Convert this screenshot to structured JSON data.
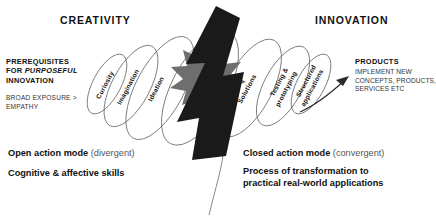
{
  "headings": {
    "left": "CREATIVITY",
    "right": "INNOVATION"
  },
  "left_block": {
    "title_line1": "PREREQUISITES",
    "title_line2_pre": "FOR ",
    "title_line2_em": "PURPOSEFUL",
    "title_line3": "INNOVATION",
    "sub": "BROAD EXPOSURE > EMPATHY"
  },
  "right_block": {
    "title": "PRODUCTS",
    "sub": "IMPLEMENT NEW CONCEPTS, PRODUCTS, SERVICES ETC"
  },
  "stages": [
    {
      "label": "Curiosity",
      "side": "creativity"
    },
    {
      "label": "Imagination",
      "side": "creativity"
    },
    {
      "label": "Ideation",
      "side": "creativity"
    },
    {
      "label": "Solutions",
      "side": "innovation"
    },
    {
      "label": "Testing &",
      "label2": "prototyping",
      "side": "innovation"
    },
    {
      "label": "Structured",
      "label2": "applications",
      "side": "innovation"
    }
  ],
  "bottom": {
    "left_bold": "Open action mode",
    "left_light": " (divergent)",
    "left_line2": "Cognitive & affective skills",
    "right_bold": "Closed action mode",
    "right_light": " (convergent)",
    "right_line2a": "Process of transformation to",
    "right_line2b": "practical real-world applications"
  },
  "colors": {
    "bolt": "#1a1a1a",
    "burst": "#6e6e6e",
    "ellipse_stroke": "#5a5a5a",
    "text": "#1a1a1a",
    "text_light": "#555555"
  }
}
